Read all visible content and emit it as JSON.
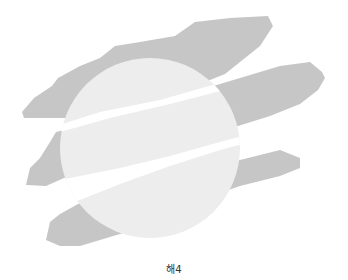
{
  "figure": {
    "caption": "해4",
    "colors": {
      "streak": "#c6c6c6",
      "disc": "#ededed",
      "background": "#ffffff"
    }
  }
}
